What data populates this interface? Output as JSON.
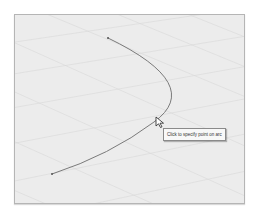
{
  "viewport": {
    "background": "#ececec",
    "border_color": "#b5b5b5",
    "grid_color": "#d6d6d6"
  },
  "arc": {
    "color": "#7a7a7a",
    "start_point": [
      107,
      37
    ],
    "end_point": [
      51,
      173
    ],
    "apex_point": [
      167,
      97
    ]
  },
  "cursor": {
    "icon": "arrow-cursor-icon",
    "position": [
      157,
      120
    ]
  },
  "tooltip": {
    "text": "Click to specify point on arc"
  }
}
